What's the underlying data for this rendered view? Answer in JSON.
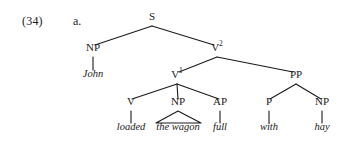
{
  "example": {
    "number": "(34)",
    "letter": "a."
  },
  "tree": {
    "nodes": [
      {
        "id": "S",
        "label": "S",
        "sup": "",
        "x": 152,
        "y": 22
      },
      {
        "id": "NP1",
        "label": "NP",
        "sup": "",
        "x": 93,
        "y": 53
      },
      {
        "id": "V2",
        "label": "V",
        "sup": "2",
        "x": 217,
        "y": 53
      },
      {
        "id": "V1",
        "label": "V",
        "sup": "1",
        "x": 177,
        "y": 80
      },
      {
        "id": "PP",
        "label": "PP",
        "sup": "",
        "x": 296,
        "y": 80
      },
      {
        "id": "V",
        "label": "V",
        "sup": "",
        "x": 131,
        "y": 107
      },
      {
        "id": "NP2",
        "label": "NP",
        "sup": "",
        "x": 178,
        "y": 107
      },
      {
        "id": "AP",
        "label": "AP",
        "sup": "",
        "x": 220,
        "y": 107
      },
      {
        "id": "P",
        "label": "P",
        "sup": "",
        "x": 269,
        "y": 107
      },
      {
        "id": "NP3",
        "label": "NP",
        "sup": "",
        "x": 322,
        "y": 107
      }
    ],
    "leaves": [
      {
        "id": "john",
        "text": "John",
        "x": 93,
        "y": 78
      },
      {
        "id": "loaded",
        "text": "loaded",
        "x": 131,
        "y": 131
      },
      {
        "id": "thewagon",
        "text": "the wagon",
        "x": 178,
        "y": 131
      },
      {
        "id": "full",
        "text": "full",
        "x": 220,
        "y": 131
      },
      {
        "id": "with",
        "text": "with",
        "x": 269,
        "y": 131
      },
      {
        "id": "hay",
        "text": "hay",
        "x": 322,
        "y": 131
      }
    ],
    "branches": [
      {
        "from": "S",
        "to": "NP1",
        "x1": 152,
        "y1": 26,
        "x2": 95,
        "y2": 45
      },
      {
        "from": "S",
        "to": "V2",
        "x1": 152,
        "y1": 26,
        "x2": 214,
        "y2": 45
      },
      {
        "from": "NP1",
        "to": "john",
        "x1": 93,
        "y1": 57,
        "x2": 93,
        "y2": 70
      },
      {
        "from": "V2",
        "to": "V1",
        "x1": 217,
        "y1": 57,
        "x2": 179,
        "y2": 72
      },
      {
        "from": "V2",
        "to": "PP",
        "x1": 217,
        "y1": 57,
        "x2": 293,
        "y2": 72
      },
      {
        "from": "V1",
        "to": "V",
        "x1": 177,
        "y1": 84,
        "x2": 132,
        "y2": 99
      },
      {
        "from": "V1",
        "to": "NP2",
        "x1": 177,
        "y1": 84,
        "x2": 178,
        "y2": 99
      },
      {
        "from": "V1",
        "to": "AP",
        "x1": 177,
        "y1": 84,
        "x2": 219,
        "y2": 99
      },
      {
        "from": "PP",
        "to": "P",
        "x1": 296,
        "y1": 84,
        "x2": 270,
        "y2": 99
      },
      {
        "from": "PP",
        "to": "NP3",
        "x1": 296,
        "y1": 84,
        "x2": 321,
        "y2": 99
      },
      {
        "from": "V",
        "to": "loaded",
        "x1": 131,
        "y1": 111,
        "x2": 131,
        "y2": 123
      },
      {
        "from": "AP",
        "to": "full",
        "x1": 220,
        "y1": 111,
        "x2": 220,
        "y2": 123
      },
      {
        "from": "P",
        "to": "with",
        "x1": 269,
        "y1": 111,
        "x2": 269,
        "y2": 123
      },
      {
        "from": "NP3",
        "to": "hay",
        "x1": 322,
        "y1": 111,
        "x2": 322,
        "y2": 123
      }
    ],
    "triangles": [
      {
        "under": "NP2",
        "apex_x": 178,
        "apex_y": 111,
        "left_x": 156,
        "right_x": 201,
        "base_y": 123
      }
    ],
    "line_color": "#1a1a1a"
  }
}
